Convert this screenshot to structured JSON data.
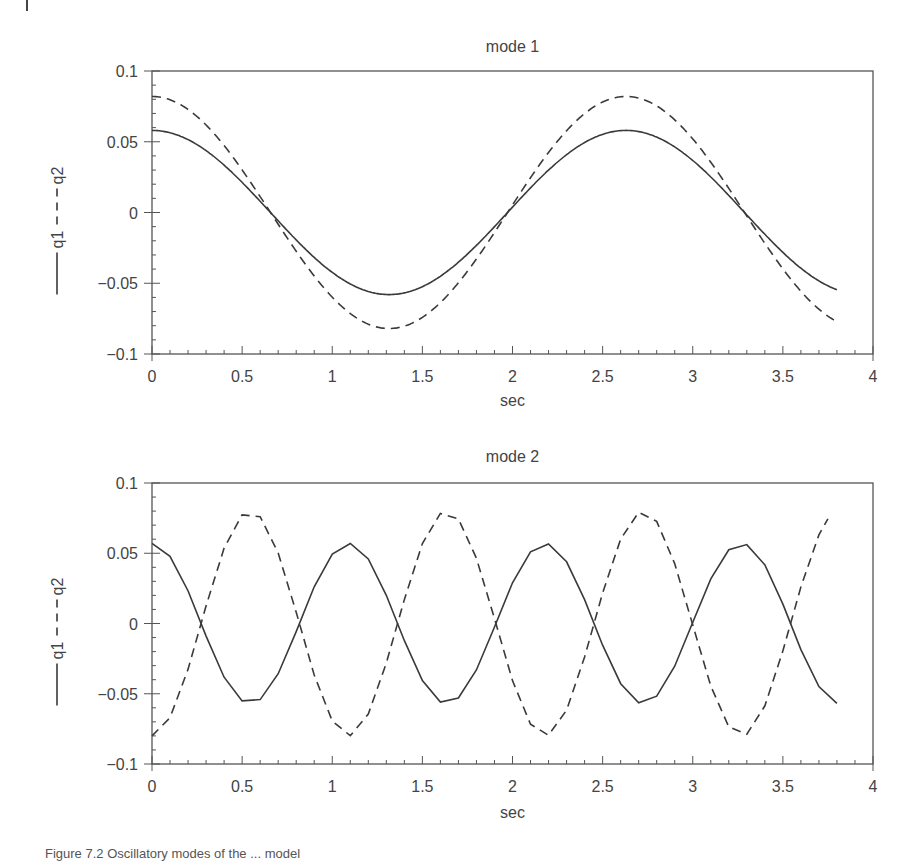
{
  "figure": {
    "caption": "Figure 7.2 Oscillatory modes of the ... model"
  },
  "chart_data": [
    {
      "type": "line",
      "title": "mode 1",
      "xlabel": "sec",
      "ylabel": "—— q1 - - - q2",
      "xlim": [
        0,
        4
      ],
      "ylim": [
        -0.1,
        0.1
      ],
      "xticks": [
        "0",
        "0.5",
        "1",
        "1.5",
        "2",
        "2.5",
        "3",
        "3.5",
        "4"
      ],
      "yticks": [
        "0.1",
        "0.05",
        "0",
        "−0.05",
        "−0.1"
      ],
      "grid": false,
      "series": [
        {
          "name": "q1",
          "style": "solid",
          "amplitude": 0.058,
          "period": 2.63,
          "phase": 0,
          "t_end": 3.8,
          "values_at": {
            "0": 0.058,
            "0.66": 0.0,
            "1.3": -0.056,
            "1.97": 0.0,
            "2.63": 0.058,
            "3.29": 0.0,
            "3.8": -0.052
          }
        },
        {
          "name": "q2",
          "style": "dashed",
          "amplitude": 0.082,
          "period": 2.63,
          "phase": 0,
          "t_end": 3.8,
          "values_at": {
            "0": 0.082,
            "0.66": 0.0,
            "1.3": -0.08,
            "1.97": 0.0,
            "2.63": 0.082,
            "3.29": 0.0,
            "3.8": -0.075
          }
        }
      ]
    },
    {
      "type": "line",
      "title": "mode 2",
      "xlabel": "sec",
      "ylabel": "—— q1 - - - q2",
      "xlim": [
        0,
        4
      ],
      "ylim": [
        -0.1,
        0.1
      ],
      "xticks": [
        "0",
        "0.5",
        "1",
        "1.5",
        "2",
        "2.5",
        "3",
        "3.5",
        "4"
      ],
      "yticks": [
        "0.1",
        "0.05",
        "0",
        "−0.05",
        "−0.1"
      ],
      "grid": false,
      "sample_step": 0.1,
      "series": [
        {
          "name": "q1",
          "style": "solid",
          "amplitude": 0.057,
          "period": 1.09,
          "phase": 0,
          "t_end": 3.8,
          "values_at": {
            "0": 0.057,
            "0.27": 0.0,
            "0.55": -0.055,
            "0.82": 0.0,
            "1.1": 0.058,
            "1.6": -0.056,
            "2.2": 0.058,
            "2.7": -0.056,
            "3.3": 0.058,
            "3.8": -0.055
          }
        },
        {
          "name": "q2",
          "style": "dashed",
          "amplitude": 0.08,
          "period": 1.09,
          "phase": 3.14159,
          "t_end": 3.75,
          "values_at": {
            "0": -0.08,
            "0.27": 0.0,
            "0.55": 0.079,
            "1.1": -0.08,
            "1.6": 0.081,
            "2.2": -0.078,
            "2.7": 0.082,
            "3.25": -0.077,
            "3.75": 0.078
          }
        }
      ]
    }
  ],
  "layout": {
    "plots": [
      {
        "left": 152,
        "right": 873,
        "top": 71,
        "bottom": 354,
        "title_y": 52,
        "xlabel_y": 406,
        "ylabel_x": 57
      },
      {
        "left": 152,
        "right": 873,
        "top": 483,
        "bottom": 764,
        "title_y": 462,
        "xlabel_y": 818,
        "ylabel_x": 57
      }
    ],
    "line_color": "#3a3a3a",
    "axis_color": "#555555"
  }
}
